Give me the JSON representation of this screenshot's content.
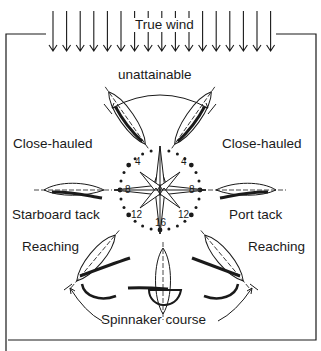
{
  "diagram": {
    "wind_label": "True wind",
    "wind_arrow_count": 17,
    "labels": {
      "unattainable": "unattainable",
      "close_hauled_left": "Close-hauled",
      "close_hauled_right": "Close-hauled",
      "starboard_tack": "Starboard tack",
      "port_tack": "Port tack",
      "reaching_left": "Reaching",
      "reaching_right": "Reaching",
      "spinnaker_course": "Spinnaker course"
    },
    "compass_numbers": {
      "top_left": "4",
      "top_right": "4",
      "left": "8",
      "right": "8",
      "bottom_left": "12",
      "bottom_right": "12",
      "bottom": "16"
    },
    "colors": {
      "ink": "#1a1a1a",
      "background": "#ffffff"
    }
  }
}
